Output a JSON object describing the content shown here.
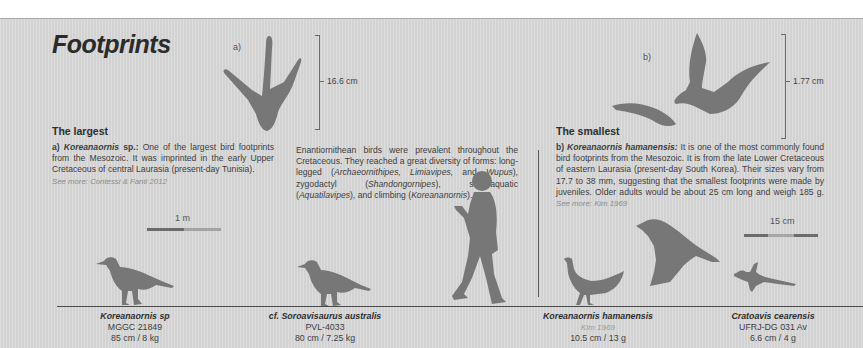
{
  "title": "Footprints",
  "colors": {
    "background": "#d9d9d9",
    "silhouette": "#777777",
    "text": "#3e3e3e"
  },
  "footprint_a": {
    "label": "a)",
    "measurement": "16.6 cm"
  },
  "footprint_b": {
    "label": "b)",
    "measurement": "1.77 cm"
  },
  "largest": {
    "heading": "The largest",
    "prefix": "a) ",
    "species": "Koreanaornis",
    "species_suffix": " sp.:",
    "text": " One of the largest bird footprints from the Mesozoic. It was imprinted in the early Upper Cretaceous of central Laurasia (present-day Tunisia).",
    "see_more": "See more: Contessi & Fanti 2012"
  },
  "middle": {
    "text_1": "Enantiornithean birds were prevalent throughout the Cretaceous. They reached a great diversity of forms: long-legged (",
    "i_1": "Archaeornithipes, Limiavipes,",
    "text_2": " and ",
    "i_2": "Wupus",
    "text_3": "), zygodactyl (",
    "i_3": "Shandongornipes",
    "text_4": "), semi-aquatic (",
    "i_4": "Aquatilavipes",
    "text_5": "), and climbing (",
    "i_5": "Koreananornis",
    "text_6": ")."
  },
  "smallest": {
    "heading": "The smallest",
    "prefix": "b) ",
    "species": "Koreanaornis hamanensis:",
    "text": " It is one of the most commonly found bird footprints from the Mesozoic. It is from the late Lower Cretaceous of eastern Laurasia (present-day South Korea). Their sizes vary from 17.7 to 38 mm, suggesting that the smallest footprints were made by juveniles. Older adults would be about 25 cm long and weigh 185 g.",
    "see_more": "See more: Kim 1969"
  },
  "scales": {
    "left": "1 m",
    "right": "15 cm"
  },
  "specimens": [
    {
      "name": "Koreanaornis sp",
      "id": "MGGC 21849",
      "size": "85 cm / 8 kg"
    },
    {
      "name": "cf. Soroavisaurus australis",
      "id": "PVL-4033",
      "size": "80 cm / 7.25 kg"
    },
    {
      "name": "Koreanaornis hamanensis",
      "ref": "Kim 1969",
      "size": "10.5 cm / 13 g"
    },
    {
      "name": "Cratoavis cearensis",
      "id": "UFRJ-DG 031 Av",
      "size": "6.6 cm / 4 g"
    }
  ]
}
